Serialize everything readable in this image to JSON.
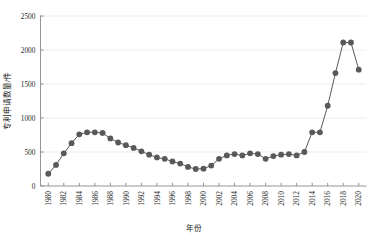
{
  "chart_data": {
    "type": "line",
    "title": "",
    "xlabel": "年份",
    "ylabel": "专利申请数量/件",
    "xlim": [
      1979,
      2021
    ],
    "ylim": [
      0,
      2500
    ],
    "ytick_values": [
      0,
      500,
      1000,
      1500,
      2000,
      2500
    ],
    "ytick_labels": [
      "0",
      "500",
      "1000",
      "1500",
      "2000",
      "2500"
    ],
    "xtick_values": [
      1980,
      1982,
      1984,
      1986,
      1988,
      1990,
      1992,
      1994,
      1996,
      1998,
      2000,
      2002,
      2004,
      2006,
      2008,
      2010,
      2012,
      2014,
      2016,
      2018,
      2020
    ],
    "xtick_labels": [
      "1980",
      "1982",
      "1984",
      "1986",
      "1988",
      "1990",
      "1992",
      "1994",
      "1996",
      "1998",
      "2000",
      "2002",
      "2004",
      "2006",
      "2008",
      "2010",
      "2012",
      "2014",
      "2016",
      "2018",
      "2020"
    ],
    "xtick_rotation": 90,
    "grid": "horizontal",
    "legend": "none",
    "marker": "circle",
    "marker_color": "#595959",
    "line_color": "#595959",
    "x": [
      1980,
      1981,
      1982,
      1983,
      1984,
      1985,
      1986,
      1987,
      1988,
      1989,
      1990,
      1991,
      1992,
      1993,
      1994,
      1995,
      1996,
      1997,
      1998,
      1999,
      2000,
      2001,
      2002,
      2003,
      2004,
      2005,
      2006,
      2007,
      2008,
      2009,
      2010,
      2011,
      2012,
      2013,
      2014,
      2015,
      2016,
      2017,
      2018,
      2019,
      2020
    ],
    "values": [
      180,
      310,
      480,
      630,
      760,
      790,
      790,
      780,
      700,
      640,
      600,
      560,
      510,
      460,
      420,
      400,
      360,
      330,
      280,
      250,
      255,
      300,
      400,
      450,
      470,
      450,
      480,
      470,
      400,
      440,
      460,
      470,
      450,
      500,
      790,
      790,
      1180,
      1660,
      2110,
      2110,
      1710
    ]
  },
  "axes": {
    "y_axis_label": "专利申请数量/件",
    "x_axis_label": "年份"
  }
}
